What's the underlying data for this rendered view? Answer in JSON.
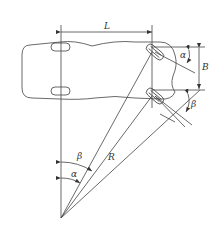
{
  "diagram": {
    "type": "vehicle-steering-geometry",
    "labels": {
      "wheelbase": "L",
      "track_width": "B",
      "inner_angle_top": "α",
      "outer_angle_top": "β",
      "inner_angle_pivot": "α",
      "outer_angle_pivot": "β",
      "radius": "R"
    },
    "colors": {
      "line": "#444444",
      "background": "#ffffff"
    }
  }
}
